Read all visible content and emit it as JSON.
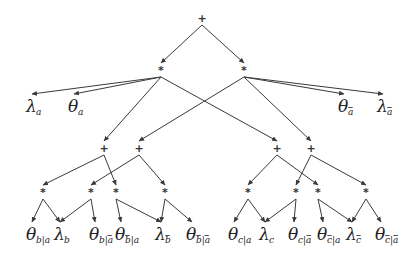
{
  "diagram": {
    "type": "arithmetic-circuit",
    "colors": {
      "edge": "#3a3a3a",
      "text": "#222222",
      "background": "#ffffff"
    },
    "nodes": [
      {
        "id": "root",
        "op": "+",
        "x": 202,
        "y": 18
      },
      {
        "id": "m_a",
        "op": "*",
        "x": 161,
        "y": 70
      },
      {
        "id": "m_na",
        "op": "*",
        "x": 244,
        "y": 70
      },
      {
        "id": "s_b1",
        "op": "+",
        "x": 104,
        "y": 148
      },
      {
        "id": "s_b2",
        "op": "+",
        "x": 139,
        "y": 148
      },
      {
        "id": "s_c1",
        "op": "+",
        "x": 277,
        "y": 148
      },
      {
        "id": "s_c2",
        "op": "+",
        "x": 311,
        "y": 148
      },
      {
        "id": "p_b1",
        "op": "*",
        "x": 43,
        "y": 192
      },
      {
        "id": "p_b2",
        "op": "*",
        "x": 91,
        "y": 192
      },
      {
        "id": "p_b3",
        "op": "*",
        "x": 116,
        "y": 192
      },
      {
        "id": "p_b4",
        "op": "*",
        "x": 165,
        "y": 192
      },
      {
        "id": "p_c1",
        "op": "*",
        "x": 248,
        "y": 192
      },
      {
        "id": "p_c2",
        "op": "*",
        "x": 296,
        "y": 192
      },
      {
        "id": "p_c3",
        "op": "*",
        "x": 318,
        "y": 192
      },
      {
        "id": "p_c4",
        "op": "*",
        "x": 366,
        "y": 192
      }
    ],
    "leaves": [
      {
        "id": "lam_a",
        "sym": "λ",
        "sub": "a",
        "subbar": [],
        "x": 32,
        "y": 108
      },
      {
        "id": "th_a",
        "sym": "θ",
        "sub": "a",
        "subbar": [],
        "x": 74,
        "y": 108
      },
      {
        "id": "th_na",
        "sym": "θ",
        "sub": "a",
        "subbar": [
          0
        ],
        "x": 344,
        "y": 108
      },
      {
        "id": "lam_na",
        "sym": "λ",
        "sub": "a",
        "subbar": [
          0
        ],
        "x": 383,
        "y": 108
      },
      {
        "id": "th_b_a",
        "sym": "θ",
        "sub": "b|a",
        "subbar": [],
        "x": 32,
        "y": 236
      },
      {
        "id": "lam_b",
        "sym": "λ",
        "sub": "b",
        "subbar": [],
        "x": 60,
        "y": 236
      },
      {
        "id": "th_b_na",
        "sym": "θ",
        "sub": "b|a",
        "subbar": [
          2
        ],
        "x": 95,
        "y": 236
      },
      {
        "id": "th_nb_a",
        "sym": "θ",
        "sub": "b|a",
        "subbar": [
          0
        ],
        "x": 121,
        "y": 236
      },
      {
        "id": "lam_nb",
        "sym": "λ",
        "sub": "b",
        "subbar": [
          0
        ],
        "x": 161,
        "y": 236
      },
      {
        "id": "th_nb_na",
        "sym": "θ",
        "sub": "b|a",
        "subbar": [
          0,
          2
        ],
        "x": 192,
        "y": 236
      },
      {
        "id": "th_c_a",
        "sym": "θ",
        "sub": "c|a",
        "subbar": [],
        "x": 234,
        "y": 236
      },
      {
        "id": "lam_c",
        "sym": "λ",
        "sub": "c",
        "subbar": [],
        "x": 265,
        "y": 236
      },
      {
        "id": "th_c_na",
        "sym": "θ",
        "sub": "c|a",
        "subbar": [
          2
        ],
        "x": 294,
        "y": 236
      },
      {
        "id": "th_nc_a",
        "sym": "θ",
        "sub": "c|a",
        "subbar": [
          0
        ],
        "x": 323,
        "y": 236
      },
      {
        "id": "lam_nc",
        "sym": "λ",
        "sub": "c",
        "subbar": [
          0
        ],
        "x": 352,
        "y": 236
      },
      {
        "id": "th_nc_na",
        "sym": "θ",
        "sub": "c|a",
        "subbar": [
          0,
          2
        ],
        "x": 381,
        "y": 236
      }
    ],
    "edges": [
      {
        "from": "root",
        "to": "m_a",
        "arrow": true
      },
      {
        "from": "root",
        "to": "m_na",
        "arrow": true
      },
      {
        "from": "m_a",
        "to": "lam_a",
        "arrow": true
      },
      {
        "from": "m_a",
        "to": "th_a",
        "arrow": true
      },
      {
        "from": "m_a",
        "to": "s_b1",
        "arrow": true
      },
      {
        "from": "m_a",
        "to": "s_c1",
        "arrow": true
      },
      {
        "from": "m_na",
        "to": "s_b2",
        "arrow": true
      },
      {
        "from": "m_na",
        "to": "s_c2",
        "arrow": true
      },
      {
        "from": "m_na",
        "to": "th_na",
        "arrow": true
      },
      {
        "from": "m_na",
        "to": "lam_na",
        "arrow": true
      },
      {
        "from": "s_b1",
        "to": "p_b1",
        "arrow": true
      },
      {
        "from": "s_b1",
        "to": "p_b3",
        "arrow": true
      },
      {
        "from": "s_b2",
        "to": "p_b2",
        "arrow": true
      },
      {
        "from": "s_b2",
        "to": "p_b4",
        "arrow": true
      },
      {
        "from": "s_c1",
        "to": "p_c1",
        "arrow": true
      },
      {
        "from": "s_c1",
        "to": "p_c3",
        "arrow": true
      },
      {
        "from": "s_c2",
        "to": "p_c2",
        "arrow": true
      },
      {
        "from": "s_c2",
        "to": "p_c4",
        "arrow": true
      },
      {
        "from": "p_b1",
        "to": "th_b_a",
        "arrow": true
      },
      {
        "from": "p_b1",
        "to": "lam_b",
        "arrow": true
      },
      {
        "from": "p_b2",
        "to": "lam_b",
        "arrow": true
      },
      {
        "from": "p_b2",
        "to": "th_b_na",
        "arrow": true
      },
      {
        "from": "p_b3",
        "to": "th_nb_a",
        "arrow": true
      },
      {
        "from": "p_b3",
        "to": "lam_nb",
        "arrow": true
      },
      {
        "from": "p_b4",
        "to": "lam_nb",
        "arrow": true
      },
      {
        "from": "p_b4",
        "to": "th_nb_na",
        "arrow": true
      },
      {
        "from": "p_c1",
        "to": "th_c_a",
        "arrow": true
      },
      {
        "from": "p_c1",
        "to": "lam_c",
        "arrow": true
      },
      {
        "from": "p_c2",
        "to": "lam_c",
        "arrow": true
      },
      {
        "from": "p_c2",
        "to": "th_c_na",
        "arrow": true
      },
      {
        "from": "p_c3",
        "to": "th_nc_a",
        "arrow": true
      },
      {
        "from": "p_c3",
        "to": "lam_nc",
        "arrow": true
      },
      {
        "from": "p_c4",
        "to": "lam_nc",
        "arrow": true
      },
      {
        "from": "p_c4",
        "to": "th_nc_na",
        "arrow": true
      }
    ]
  }
}
